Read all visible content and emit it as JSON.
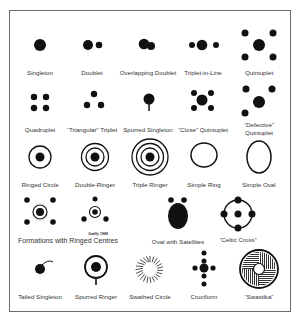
{
  "figure": {
    "items": [
      {
        "label": "Singleton"
      },
      {
        "label": "Doublet"
      },
      {
        "label": "Overlapping Doublet"
      },
      {
        "label": "Triplet-in-Line"
      },
      {
        "label": "Quintuplet"
      },
      {
        "label": "Quadruplet"
      },
      {
        "label": "“Triangular” Triplet"
      },
      {
        "label": "Spurred Singleton"
      },
      {
        "label": "“Close” Quintuplet"
      },
      {
        "label": "“Defective”",
        "label2": "Quintuplet"
      },
      {
        "label": "Ringed Circle"
      },
      {
        "label": "Double-Ringer"
      },
      {
        "label": "Triple Ringer"
      },
      {
        "label": "Simple Ring"
      },
      {
        "label": "Simple Oval"
      },
      {
        "label": "Formations with Ringed Centres"
      },
      {
        "label": "Oval with Satellites"
      },
      {
        "label": "“Celtic Cross”"
      },
      {
        "label": "Tailed Singleton"
      },
      {
        "label": "Spurred Ringer"
      },
      {
        "label": "Swathed  Circle"
      },
      {
        "label": "Cruciform"
      },
      {
        "label": "“Swastika”"
      }
    ],
    "credit": "Gadfly 1988"
  }
}
